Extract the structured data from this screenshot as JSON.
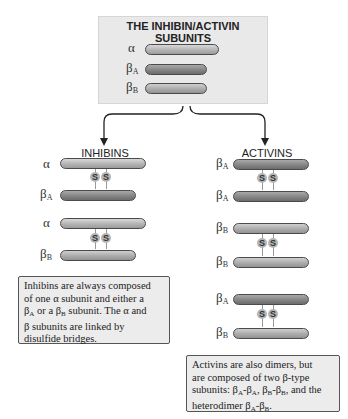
{
  "subunits_box": {
    "title": "THE INHIBIN/ACTIVIN SUBUNITS",
    "labels": {
      "alpha": "α",
      "beta": "β",
      "A": "A",
      "B": "B"
    }
  },
  "inhibins": {
    "heading": "INHIBINS",
    "pairs": [
      {
        "top": "α",
        "bottom": "β",
        "bottom_sub": "A"
      },
      {
        "top": "α",
        "bottom": "β",
        "bottom_sub": "B"
      }
    ],
    "bridge_label": "S",
    "note": {
      "l1": "Inhibins are always composed",
      "l2": "of one α subunit and either a",
      "l3a": "β",
      "l3sa": "A",
      "l3b": " or a β",
      "l3sb": "B",
      "l3c": " subunit. The α and",
      "l4": "β subunits are linked by",
      "l5": "disulfide bridges."
    }
  },
  "activins": {
    "heading": "ACTIVINS",
    "pairs": [
      {
        "top": "β",
        "top_sub": "A",
        "bottom": "β",
        "bottom_sub": "A"
      },
      {
        "top": "β",
        "top_sub": "B",
        "bottom": "β",
        "bottom_sub": "B"
      },
      {
        "top": "β",
        "top_sub": "A",
        "bottom": "β",
        "bottom_sub": "B"
      }
    ],
    "note": {
      "l1": "Activins are also dimers, but",
      "l2": "are composed of two β-type",
      "l3a": "subunits: β",
      "l3s1": "A",
      "l3b": "-β",
      "l3s2": "A",
      "l3c": ", β",
      "l3s3": "B",
      "l3d": "-β",
      "l3s4": "B",
      "l3e": ", and the",
      "l4a": "heterodimer β",
      "l4s1": "A",
      "l4b": "-β",
      "l4s2": "B",
      "l4c": "."
    }
  },
  "colors": {
    "alpha": "#b4b4b4",
    "betaA": "#858585",
    "betaB": "#ababab",
    "box": "#e9e9e9"
  }
}
